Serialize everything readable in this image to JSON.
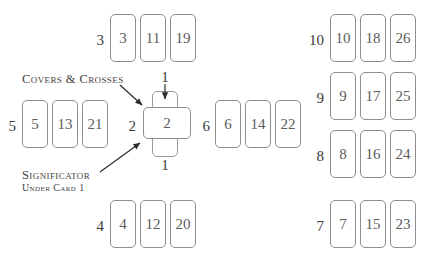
{
  "diagram": {
    "card_border_color": "#8d8d8d",
    "card_number_color": "#5c5c5c",
    "label_color": "#3a3a3a",
    "annotation_color": "#44413f",
    "background_color": "#ffffff"
  },
  "annotations": {
    "covers_crosses": "Covers & Crosses",
    "significator": "Significator",
    "significator_sub": "Under Card 1"
  },
  "center": {
    "vertical_card_label": "1",
    "horizontal_card_label": "2",
    "top_step": "1",
    "bottom_step": "1",
    "left_step": "2"
  },
  "groups": [
    {
      "name": "top-row",
      "label": "3",
      "cards": [
        "3",
        "11",
        "19"
      ]
    },
    {
      "name": "left-row",
      "label": "5",
      "cards": [
        "5",
        "13",
        "21"
      ]
    },
    {
      "name": "middle-right-row",
      "label": "6",
      "cards": [
        "6",
        "14",
        "22"
      ]
    },
    {
      "name": "bottom-row",
      "label": "4",
      "cards": [
        "4",
        "12",
        "20"
      ]
    },
    {
      "name": "staff-row-10",
      "label": "10",
      "cards": [
        "10",
        "18",
        "26"
      ]
    },
    {
      "name": "staff-row-9",
      "label": "9",
      "cards": [
        "9",
        "17",
        "25"
      ]
    },
    {
      "name": "staff-row-8",
      "label": "8",
      "cards": [
        "8",
        "16",
        "24"
      ]
    },
    {
      "name": "staff-row-7",
      "label": "7",
      "cards": [
        "7",
        "15",
        "23"
      ]
    }
  ]
}
